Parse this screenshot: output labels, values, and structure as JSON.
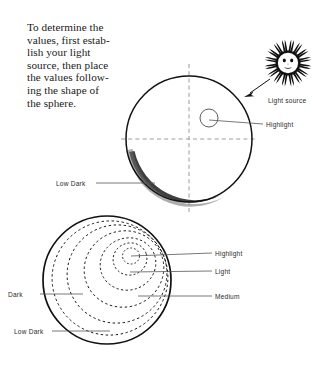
{
  "instruction": {
    "name": "instruction-paragraph",
    "lines": [
      "To determine the",
      "values, first estab-",
      "lish your light",
      "source, then place",
      "the values follow-",
      "ing the shape of",
      "the sphere."
    ]
  },
  "icons": {
    "sun": "sun-icon",
    "arrow": "light-direction-arrow-icon"
  },
  "labels": {
    "light_source": "Light source",
    "highlight_top": "Highlight",
    "low_dark_top": "Low Dark",
    "highlight_bottom": "Highlight",
    "light_bottom": "Light",
    "medium_bottom": "Medium",
    "dark_bottom": "Dark",
    "low_dark_bottom": "Low Dark"
  },
  "colors": {
    "ink": "#111111",
    "label_ink": "#2b2b2b",
    "leader_line": "#555555",
    "axis_dash": "#9a9aa5",
    "shadow_crescent": "#2a2a2a",
    "page_background": "#ffffff"
  },
  "figures": {
    "upper_sphere": {
      "name": "upper-sphere-diagram",
      "center": [
        189,
        139
      ],
      "radius": 63,
      "axes": "dashed-crosshair",
      "highlight_circle": {
        "center": [
          209,
          118
        ],
        "radius": 9
      },
      "shading": "low-dark-crescent-lower-left"
    },
    "lower_sphere": {
      "name": "lower-sphere-diagram",
      "center": [
        107,
        280
      ],
      "radius": 64,
      "contours": "nested-dashed-value-rings",
      "ring_count": 5
    }
  }
}
